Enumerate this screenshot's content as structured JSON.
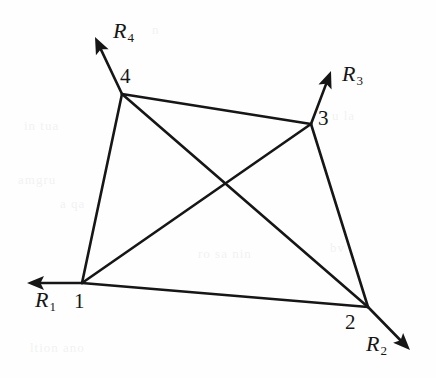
{
  "figure": {
    "type": "free-body-diagram",
    "background_color": "#fefefe",
    "line_color": "#161616",
    "line_width": 2.6,
    "nodes": [
      {
        "id": "1",
        "label": "1",
        "x": 82,
        "y": 283,
        "label_x": 74,
        "label_y": 291
      },
      {
        "id": "2",
        "label": "2",
        "x": 368,
        "y": 307,
        "label_x": 345,
        "label_y": 312
      },
      {
        "id": "3",
        "label": "3",
        "x": 311,
        "y": 124,
        "label_x": 318,
        "label_y": 108
      },
      {
        "id": "4",
        "label": "4",
        "x": 122,
        "y": 94,
        "label_x": 120,
        "label_y": 66
      }
    ],
    "edges": [
      {
        "name": "edge-1-2",
        "from": "1",
        "to": "2"
      },
      {
        "name": "edge-2-3",
        "from": "2",
        "to": "3"
      },
      {
        "name": "edge-3-4",
        "from": "3",
        "to": "4"
      },
      {
        "name": "edge-4-1",
        "from": "4",
        "to": "1"
      },
      {
        "name": "diagonal-1-3",
        "from": "1",
        "to": "3"
      },
      {
        "name": "diagonal-4-2",
        "from": "4",
        "to": "2"
      }
    ],
    "diagonal_crossing": {
      "x": 218,
      "y": 183
    },
    "forces": [
      {
        "name": "R1",
        "label": "R",
        "subscript": "1",
        "at_node": "1",
        "tip_x": 27,
        "tip_y": 283,
        "label_x": 35,
        "label_y": 289
      },
      {
        "name": "R2",
        "label": "R",
        "subscript": "2",
        "at_node": "2",
        "tip_x": 410,
        "tip_y": 350,
        "label_x": 366,
        "label_y": 333
      },
      {
        "name": "R3",
        "label": "R",
        "subscript": "3",
        "at_node": "3",
        "tip_x": 331,
        "tip_y": 71,
        "label_x": 342,
        "label_y": 63
      },
      {
        "name": "R4",
        "label": "R",
        "subscript": "4",
        "at_node": "4",
        "tip_x": 95,
        "tip_y": 37,
        "label_x": 113,
        "label_y": 20
      }
    ],
    "arrowhead": {
      "length": 17,
      "half_width": 7
    }
  }
}
